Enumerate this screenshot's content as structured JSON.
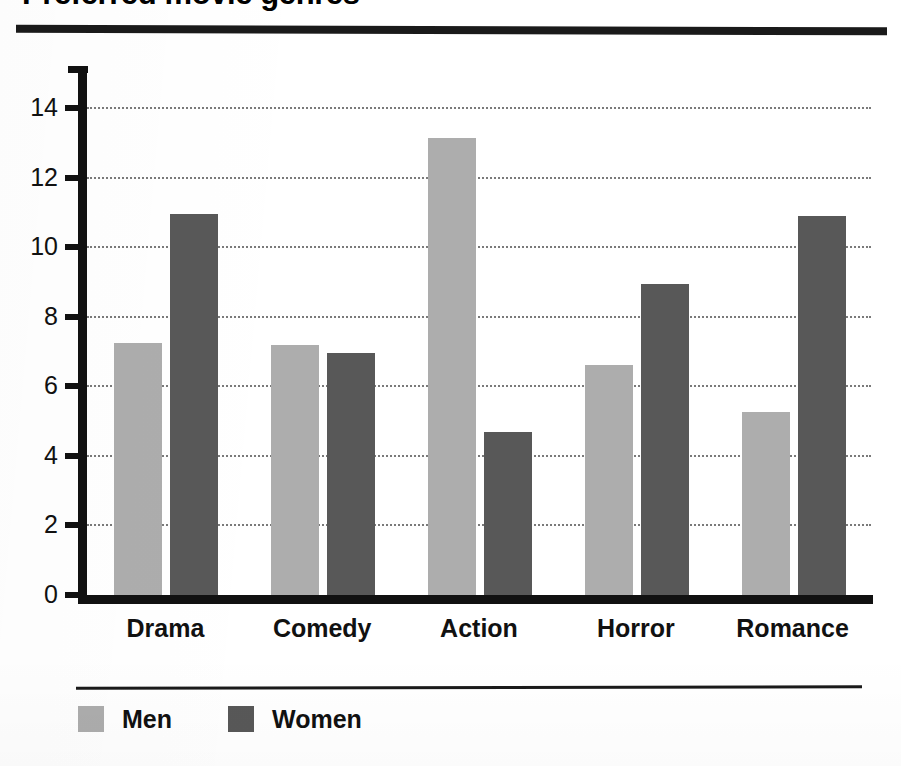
{
  "chart_data": {
    "type": "bar",
    "title": "Preferred movie genres",
    "xlabel": "",
    "ylabel": "",
    "categories": [
      "Drama",
      "Comedy",
      "Action",
      "Horror",
      "Romance"
    ],
    "series": [
      {
        "name": "Men",
        "color": "#adadad",
        "values": [
          7.25,
          7.2,
          13.15,
          6.6,
          5.25
        ]
      },
      {
        "name": "Women",
        "color": "#585858",
        "values": [
          10.95,
          6.95,
          4.7,
          8.95,
          10.9
        ]
      }
    ],
    "ylim": [
      0,
      14
    ],
    "yticks": [
      0,
      2,
      4,
      6,
      8,
      10,
      12,
      14
    ],
    "ytick_labels": [
      "0",
      "2",
      "4",
      "6",
      "8",
      "10",
      "12",
      "14"
    ],
    "grid": "horizontal-dotted",
    "legend_position": "bottom-left"
  },
  "axis": {
    "tick_0": "0",
    "tick_2": "2",
    "tick_4": "4",
    "tick_6": "6",
    "tick_8": "8",
    "tick_10": "10",
    "tick_12": "12",
    "tick_14": "14"
  },
  "categories": {
    "c0": "Drama",
    "c1": "Comedy",
    "c2": "Action",
    "c3": "Horror",
    "c4": "Romance"
  },
  "legend": {
    "men": "Men",
    "women": "Women"
  },
  "colors": {
    "men": "#adadad",
    "women": "#585858",
    "axis": "#111111",
    "grid": "#7a7a7a",
    "rule": "#1a1a1a",
    "background": "#ffffff"
  }
}
